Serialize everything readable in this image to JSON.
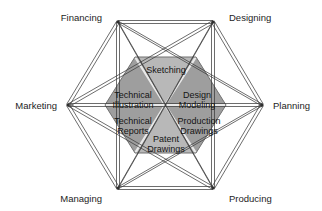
{
  "diagram": {
    "type": "hexagon-network-diagram",
    "title_present": false,
    "background_color": "#ffffff",
    "line_color": "#3a3a3a",
    "center": {
      "x": 165,
      "y": 105
    },
    "outer_nodes": [
      {
        "id": "financing",
        "label": "Financing",
        "vertex": {
          "x": 118,
          "y": 22
        },
        "label_pos": {
          "x": 100,
          "y": 18
        },
        "anchor": "end"
      },
      {
        "id": "designing",
        "label": "Designing",
        "vertex": {
          "x": 213,
          "y": 22
        },
        "label_pos": {
          "x": 231,
          "y": 18
        },
        "anchor": "start"
      },
      {
        "id": "planning",
        "label": "Planning",
        "vertex": {
          "x": 262,
          "y": 105
        },
        "label_pos": {
          "x": 272,
          "y": 108
        },
        "anchor": "start"
      },
      {
        "id": "producing",
        "label": "Producing",
        "vertex": {
          "x": 213,
          "y": 188
        },
        "label_pos": {
          "x": 231,
          "y": 200
        },
        "anchor": "start"
      },
      {
        "id": "managing",
        "label": "Managing",
        "vertex": {
          "x": 118,
          "y": 188
        },
        "label_pos": {
          "x": 100,
          "y": 200
        },
        "anchor": "end"
      },
      {
        "id": "marketing",
        "label": "Marketing",
        "vertex": {
          "x": 68,
          "y": 105
        },
        "label_pos": {
          "x": 58,
          "y": 108
        },
        "anchor": "end"
      }
    ],
    "inner_hexagon": {
      "fill_dark": "#9d9d9d",
      "fill_light": "#b6b6b6",
      "divider_color": "#e8e8e8",
      "outline_color": "#6f6f6f",
      "wedges": [
        {
          "id": "sketching",
          "label_line1": "Sketching",
          "label_line2": "",
          "shade": "light",
          "label_pos": {
            "x": 166,
            "y": 70
          }
        },
        {
          "id": "design-modeling",
          "label_line1": "Design",
          "label_line2": "Modeling",
          "shade": "dark",
          "label_pos": {
            "x": 197,
            "y": 97
          }
        },
        {
          "id": "production-drawings",
          "label_line1": "Production",
          "label_line2": "Drawings",
          "shade": "dark",
          "label_pos": {
            "x": 199,
            "y": 123
          }
        },
        {
          "id": "patent-drawings",
          "label_line1": "Patent",
          "label_line2": "Drawings",
          "shade": "light",
          "label_pos": {
            "x": 166,
            "y": 140
          }
        },
        {
          "id": "technical-reports",
          "label_line1": "Technical",
          "label_line2": "Reports",
          "shade": "dark",
          "label_pos": {
            "x": 133,
            "y": 123
          }
        },
        {
          "id": "technical-illustration",
          "label_line1": "Technical",
          "label_line2": "Illustration",
          "shade": "dark",
          "label_pos": {
            "x": 133,
            "y": 97
          }
        }
      ]
    },
    "connections_note": "every outer node connects to every other outer node"
  }
}
